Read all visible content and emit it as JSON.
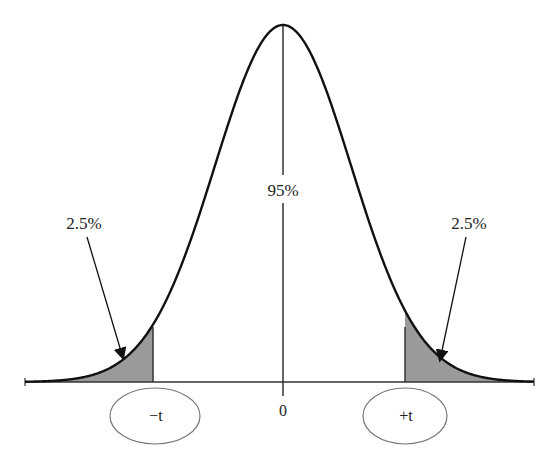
{
  "chart_data": {
    "type": "area",
    "title": "",
    "center_label": "95%",
    "left_tail": {
      "percent_label": "2.5%",
      "critical_label": "-t",
      "shaded": true
    },
    "right_tail": {
      "percent_label": "2.5%",
      "critical_label": "+t",
      "shaded": true
    },
    "x_ticks": [
      {
        "label": "-t"
      },
      {
        "label": "0"
      },
      {
        "label": "+t"
      }
    ],
    "grid": false,
    "colors": {
      "curve": "#111111",
      "shade": "#9a9a9a",
      "axis": "#333333"
    }
  },
  "labels": {
    "center": "95%",
    "left_pct": "2.5%",
    "right_pct": "2.5%",
    "neg_t": "−t",
    "zero": "0",
    "pos_t": "+t"
  }
}
